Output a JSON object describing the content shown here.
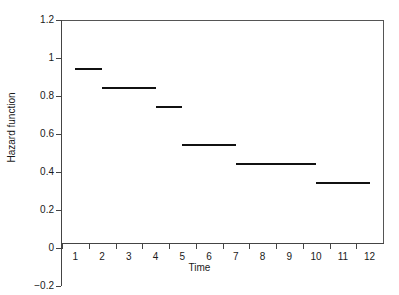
{
  "chart_data": {
    "type": "line",
    "subtype": "step-function",
    "title": "",
    "xlabel": "Time",
    "ylabel": "Hazard function",
    "xlim": [
      0.5,
      12.5
    ],
    "ylim": [
      -0.2,
      1.2
    ],
    "ytick_labels": [
      "1.2",
      "1",
      "0.8",
      "0.6",
      "0.4",
      "0.2",
      "0",
      "−0.2"
    ],
    "ytick_values": [
      1.2,
      1,
      0.8,
      0.6,
      0.4,
      0.2,
      0,
      -0.2
    ],
    "xtick_labels": [
      "1",
      "2",
      "3",
      "4",
      "5",
      "6",
      "7",
      "8",
      "9",
      "10",
      "11",
      "12"
    ],
    "xtick_values": [
      1,
      2,
      3,
      4,
      5,
      6,
      7,
      8,
      9,
      10,
      11,
      12
    ],
    "grid": false,
    "legend": null,
    "series": [
      {
        "name": "Hazard function",
        "color": "#111111",
        "segments": [
          {
            "x_start": 1,
            "x_end": 2,
            "value": 0.95
          },
          {
            "x_start": 2,
            "x_end": 4,
            "value": 0.85
          },
          {
            "x_start": 4,
            "x_end": 5,
            "value": 0.75
          },
          {
            "x_start": 5,
            "x_end": 7,
            "value": 0.55
          },
          {
            "x_start": 7,
            "x_end": 10,
            "value": 0.45
          },
          {
            "x_start": 10,
            "x_end": 12,
            "value": 0.35
          }
        ]
      }
    ]
  }
}
